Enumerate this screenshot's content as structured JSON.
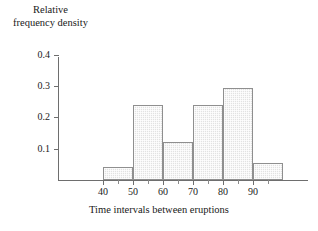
{
  "chart_data": {
    "type": "bar",
    "title": "",
    "ylabel": "Relative frequency density",
    "ylabel_lines": [
      "Relative",
      "frequency density"
    ],
    "xlabel": "Time intervals between eruptions",
    "categories": [
      "40-50",
      "50-60",
      "60-70",
      "70-80",
      "80-90",
      "90-100"
    ],
    "bin_edges": [
      40,
      50,
      60,
      70,
      80,
      90,
      100
    ],
    "values": [
      0.04,
      0.24,
      0.12,
      0.24,
      0.295,
      0.055
    ],
    "xlim": [
      35,
      100
    ],
    "ylim": [
      0,
      0.43
    ],
    "yticks": [
      0.1,
      0.2,
      0.3,
      0.4
    ],
    "ytick_labels": [
      "0.1",
      "0.2",
      "0.3",
      "0.4"
    ],
    "xticks": [
      40,
      50,
      60,
      70,
      80,
      90
    ],
    "xtick_labels": [
      "40",
      "50",
      "60",
      "70",
      "80",
      "90"
    ],
    "x_minor_ticks": [
      45,
      55,
      65,
      75,
      85,
      95
    ],
    "grid": false,
    "legend": false,
    "bar_fill": "#e2e2e2",
    "bar_edge": "#8f8f8f",
    "axis_color": "#6e6e6e"
  }
}
